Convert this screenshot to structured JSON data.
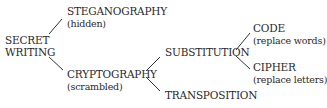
{
  "diagram": {
    "type": "tree",
    "root": {
      "label_line1": "SECRET",
      "label_line2": "WRITING"
    },
    "nodes": {
      "steganography": {
        "label": "STEGANOGRAPHY",
        "note": "(hidden)"
      },
      "cryptography": {
        "label": "CRYPTOGRAPHY",
        "note": "(scrambled)"
      },
      "substitution": {
        "label": "SUBSTITUTION"
      },
      "transposition": {
        "label": "TRANSPOSITION"
      },
      "code": {
        "label": "CODE",
        "note": "(replace words)"
      },
      "cipher": {
        "label": "CIPHER",
        "note": "(replace letters)"
      }
    },
    "edges": [
      [
        "SECRET WRITING",
        "STEGANOGRAPHY"
      ],
      [
        "SECRET WRITING",
        "CRYPTOGRAPHY"
      ],
      [
        "CRYPTOGRAPHY",
        "SUBSTITUTION"
      ],
      [
        "CRYPTOGRAPHY",
        "TRANSPOSITION"
      ],
      [
        "SUBSTITUTION",
        "CODE"
      ],
      [
        "SUBSTITUTION",
        "CIPHER"
      ]
    ],
    "colors": {
      "text": "#2a2a2a",
      "line": "#333333",
      "background": "#ffffff"
    }
  }
}
